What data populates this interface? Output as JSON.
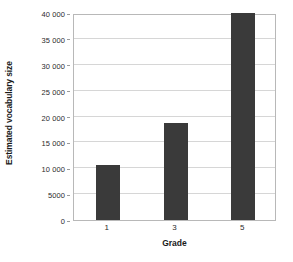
{
  "chart_data": {
    "type": "bar",
    "title": "",
    "xlabel": "Grade",
    "ylabel": "Estimated vocabulary size",
    "categories": [
      "1",
      "3",
      "5"
    ],
    "values": [
      10600,
      18800,
      40000
    ],
    "series": [
      {
        "name": "Estimated vocabulary size",
        "values": [
          10600,
          18800,
          40000
        ]
      }
    ],
    "ylim": [
      0,
      40000
    ],
    "ytick_values": [
      0,
      5000,
      10000,
      15000,
      20000,
      25000,
      30000,
      35000,
      40000
    ],
    "ytick_labels": [
      "0",
      "5000",
      "10 000",
      "15 000",
      "20 000",
      "25 000",
      "30 000",
      "35 000",
      "40 000"
    ],
    "grid": "horizontal",
    "legend": "none",
    "bar_color": "#3a3a3a",
    "gridline_color": "#d6d6d6",
    "axis_border_color": "#b8b8b8",
    "background_color": "#ffffff"
  }
}
